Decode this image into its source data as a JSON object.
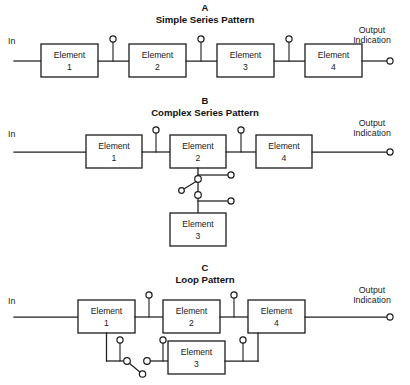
{
  "figure": {
    "width": 410,
    "height": 385,
    "background_color": "#ffffff",
    "line_color": "#1d1d1d"
  },
  "panels": [
    {
      "letter": "A",
      "title": "Simple Series Pattern",
      "input_label": "In",
      "output_label_line1": "Output",
      "output_label_line2": "Indication",
      "blocks": [
        {
          "name": "Element",
          "number": "1"
        },
        {
          "name": "Element",
          "number": "2"
        },
        {
          "name": "Element",
          "number": "3"
        },
        {
          "name": "Element",
          "number": "4"
        }
      ],
      "test_point_count": 3,
      "output_terminal": true
    },
    {
      "letter": "B",
      "title": "Complex Series Pattern",
      "input_label": "In",
      "output_label_line1": "Output",
      "output_label_line2": "Indication",
      "blocks": [
        {
          "name": "Element",
          "number": "1"
        },
        {
          "name": "Element",
          "number": "2"
        },
        {
          "name": "Element",
          "number": "4"
        },
        {
          "name": "Element",
          "number": "3"
        }
      ],
      "test_point_count": 2,
      "branch_terminal_count": 2,
      "switch_count": 1,
      "output_terminal": true
    },
    {
      "letter": "C",
      "title": "Loop  Pattern",
      "input_label": "In",
      "output_label_line1": "Output",
      "output_label_line2": "Indication",
      "blocks": [
        {
          "name": "Element",
          "number": "1"
        },
        {
          "name": "Element",
          "number": "2"
        },
        {
          "name": "Element",
          "number": "4"
        },
        {
          "name": "Element",
          "number": "3"
        }
      ],
      "test_point_count": 5,
      "switch_count": 1,
      "output_terminal": true
    }
  ]
}
